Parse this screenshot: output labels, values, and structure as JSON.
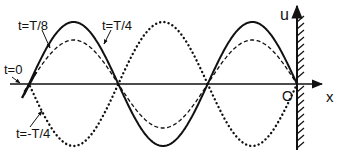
{
  "diagram": {
    "axes": {
      "x_label": "x",
      "y_label": "u",
      "origin_label": "O"
    },
    "curves": [
      {
        "label": "t=0",
        "style": "axis-coincident",
        "description": "displacement zero along the axis"
      },
      {
        "label": "t=T/8",
        "style": "dashed",
        "amplitude_px": 44
      },
      {
        "label": "t=T/4",
        "style": "solid",
        "amplitude_px": 62
      },
      {
        "label": "t=-T/4",
        "style": "dotted",
        "amplitude_px": -62
      }
    ],
    "labels": {
      "t0": "t=0",
      "tT8": "t=T/8",
      "tT4": "t=T/4",
      "tmT4": "t=-T/4"
    },
    "colors": {
      "ink": "#111111",
      "background": "#ffffff"
    },
    "geometry": {
      "axis_y": 84,
      "zero_crossings_x": [
        29,
        119,
        208,
        297
      ],
      "wall_x": 297
    }
  }
}
